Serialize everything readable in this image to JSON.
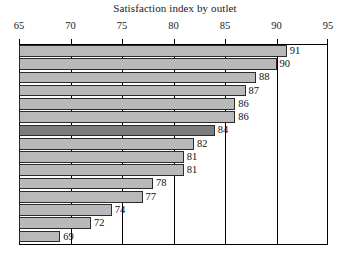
{
  "chart_data": {
    "type": "bar",
    "orientation": "horizontal",
    "title": "Satisfaction index by outlet",
    "xlabel": "",
    "ylabel": "",
    "xlim": [
      65,
      95
    ],
    "xticks": [
      65,
      70,
      75,
      80,
      85,
      90,
      95
    ],
    "xtick_labels": [
      "65",
      "70",
      "75",
      "80",
      "85",
      "90",
      "95"
    ],
    "grid": true,
    "grid_axis": "x",
    "legend": "none",
    "categories": [
      "outlet-1",
      "outlet-2",
      "outlet-3",
      "outlet-4",
      "outlet-5",
      "outlet-6",
      "outlet-7",
      "outlet-8",
      "outlet-9",
      "outlet-10",
      "outlet-11",
      "outlet-12",
      "outlet-13",
      "outlet-14",
      "outlet-15"
    ],
    "values": [
      91,
      90,
      88,
      87,
      86,
      86,
      84,
      82,
      81,
      81,
      78,
      77,
      74,
      72,
      69
    ],
    "data_labels": [
      "91",
      "90",
      "88",
      "87",
      "86",
      "86",
      "84",
      "82",
      "81",
      "81",
      "78",
      "77",
      "74",
      "72",
      "69"
    ],
    "highlight_index": 6,
    "colors": {
      "bar": "#b9b9b9",
      "bar_highlight": "#7d7d7d",
      "bar_edge": "#2b2b2b",
      "frame": "#000000",
      "text": "#111111",
      "background": "#ffffff"
    }
  }
}
